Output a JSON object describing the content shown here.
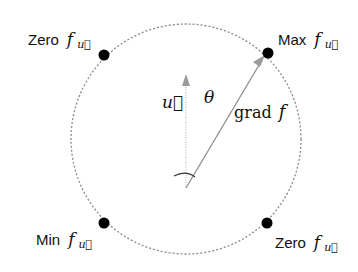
{
  "diagram": {
    "colors": {
      "background": "#ffffff",
      "circle": "#8a8a8a",
      "dot": "#000000",
      "text": "#111111",
      "vector": "#9a9a9a"
    },
    "labels": {
      "zero_top_left": {
        "word": "Zero",
        "symbol": "f",
        "subscript": "u⃗"
      },
      "max_top_right": {
        "word": "Max",
        "symbol": "f",
        "subscript": "u⃗"
      },
      "min_bottom_left": {
        "word": "Min",
        "symbol": "f",
        "subscript": "u⃗"
      },
      "zero_bottom_right": {
        "word": "Zero",
        "symbol": "f",
        "subscript": "u⃗"
      },
      "u_vector": "u⃗",
      "angle": "θ",
      "grad_word": "grad",
      "grad_symbol": "f"
    }
  }
}
